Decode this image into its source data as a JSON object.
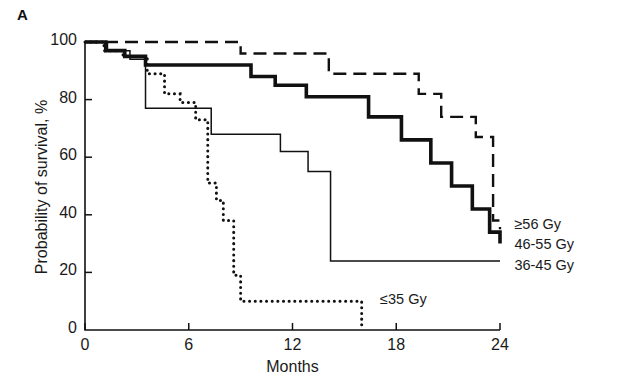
{
  "figure": {
    "panel_label": "A",
    "xlabel": "Months",
    "ylabel": "Probability of survival, %"
  },
  "chart_data": {
    "type": "line",
    "title": "",
    "subtitle": "",
    "xlabel": "Months",
    "ylabel": "Probability of survival, %",
    "xlim": [
      0,
      24
    ],
    "ylim": [
      0,
      100
    ],
    "xticks": [
      0,
      6,
      12,
      18,
      24
    ],
    "yticks": [
      0,
      20,
      40,
      60,
      80,
      100
    ],
    "xtick_labels": [
      "0",
      "6",
      "12",
      "18",
      "24"
    ],
    "ytick_labels": [
      "0",
      "20",
      "40",
      "60",
      "80",
      "100"
    ],
    "grid": false,
    "legend_position": "right-inline",
    "step_style": "post",
    "annotations": [
      {
        "text": "≥56 Gy",
        "x": 24.6,
        "y": 36,
        "series": "ge56"
      },
      {
        "text": "46-55 Gy",
        "x": 24.6,
        "y": 29,
        "series": "46_55"
      },
      {
        "text": "36-45 Gy",
        "x": 24.6,
        "y": 22,
        "series": "36_45"
      },
      {
        "text": "≤35 Gy",
        "x": 16.6,
        "y": 10,
        "series": "le35"
      }
    ],
    "series": [
      {
        "name": "≥56 Gy",
        "key": "ge56",
        "line_style": "dashed",
        "line_width": 2.4,
        "color": "#111111",
        "x": [
          0,
          1.7,
          3.6,
          9.0,
          11.4,
          14.1,
          16.6,
          19.3,
          20.6,
          21.7,
          22.6,
          23.6,
          24.0
        ],
        "y": [
          100,
          100,
          100,
          96,
          96,
          89,
          89,
          82,
          74,
          74,
          67,
          38,
          35
        ]
      },
      {
        "name": "46-55 Gy",
        "key": "46_55",
        "line_style": "solid-thick",
        "line_width": 3.6,
        "color": "#111111",
        "x": [
          0,
          1.2,
          2.3,
          3.5,
          7.3,
          9.6,
          11.0,
          12.8,
          14.4,
          16.4,
          18.3,
          20.0,
          21.2,
          22.4,
          23.4,
          24.0
        ],
        "y": [
          100,
          97,
          95,
          92,
          92,
          88,
          85,
          81,
          81,
          74,
          66,
          58,
          50,
          42,
          34,
          30
        ]
      },
      {
        "name": "36-45 Gy",
        "key": "36_45",
        "line_style": "solid-thin",
        "line_width": 1.5,
        "color": "#111111",
        "x": [
          0,
          1.3,
          2.6,
          3.5,
          6.1,
          7.3,
          9.6,
          11.3,
          12.9,
          14.2,
          24.0
        ],
        "y": [
          100,
          97,
          94,
          77,
          77,
          68,
          68,
          62,
          55,
          24,
          24
        ]
      },
      {
        "name": "≤35 Gy",
        "key": "le35",
        "line_style": "dotted",
        "line_width": 3.0,
        "color": "#111111",
        "x": [
          0,
          1.1,
          2.2,
          3.6,
          4.6,
          5.5,
          6.4,
          7.1,
          7.6,
          8.0,
          8.6,
          9.0,
          16.0
        ],
        "y": [
          100,
          97,
          95,
          89,
          82,
          79,
          73,
          51,
          45,
          38,
          19,
          10,
          10
        ],
        "terminal_drop_to_zero": true,
        "terminal_x": 16.0
      }
    ]
  }
}
